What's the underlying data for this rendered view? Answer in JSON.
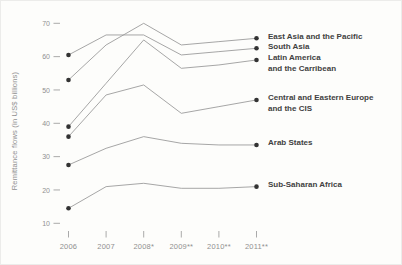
{
  "figure": {
    "y_axis_title": "Remittance flows (in US$ billions)"
  },
  "chart_data": {
    "type": "line",
    "categories": [
      "2006",
      "2007",
      "2008*",
      "2009**",
      "2010**",
      "2011**"
    ],
    "series": [
      {
        "name": "East Asia and the Pacific",
        "label_lines": [
          "East Asia and the Pacific"
        ],
        "values": [
          53,
          63.5,
          70,
          63.5,
          64.5,
          65.5
        ]
      },
      {
        "name": "South Asia",
        "label_lines": [
          "South Asia"
        ],
        "values": [
          60.5,
          66.5,
          66.5,
          60.5,
          61.5,
          62.5
        ]
      },
      {
        "name": "Latin America and the Carribean",
        "label_lines": [
          "Latin America",
          "and the Carribean"
        ],
        "values": [
          39,
          52,
          65,
          56.5,
          57.5,
          59
        ]
      },
      {
        "name": "Central and Eastern Europe and the CIS",
        "label_lines": [
          "Central and Eastern Europe",
          "and the CIS"
        ],
        "values": [
          36,
          48.5,
          51.5,
          43,
          45,
          47
        ]
      },
      {
        "name": "Arab States",
        "label_lines": [
          "Arab States"
        ],
        "values": [
          27.5,
          32.5,
          36,
          34,
          33.5,
          33.5
        ]
      },
      {
        "name": "Sub-Saharan Africa",
        "label_lines": [
          "Sub-Saharan Africa"
        ],
        "values": [
          14.5,
          21,
          22,
          20.5,
          20.5,
          21
        ]
      }
    ],
    "ylabel": "Remittance flows (in US$ billions)",
    "ylim": [
      10,
      70
    ],
    "y_ticks": [
      10,
      20,
      30,
      40,
      50,
      60,
      70
    ],
    "grid": false,
    "markers": "endpoints-only",
    "legend_position": "right-of-line-endpoints",
    "colors": {
      "line": "#9c9c9c",
      "marker": "#333333",
      "tick_mark": "#a0a0a0",
      "axis_text": "#909090",
      "legend_text": "#414141",
      "background": "#fdfdfb"
    }
  }
}
